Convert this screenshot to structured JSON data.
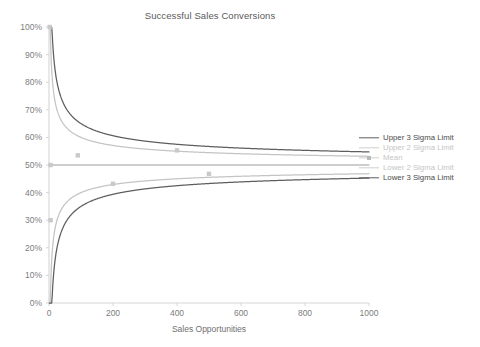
{
  "chart_data": {
    "type": "line",
    "title": "Successful Sales Conversions",
    "xlabel": "Sales Opportunities",
    "ylabel": "",
    "xlim": [
      0,
      1000
    ],
    "ylim": [
      0,
      1
    ],
    "xticks": [
      0,
      200,
      400,
      600,
      800,
      1000
    ],
    "xtick_labels": [
      "0",
      "200",
      "400",
      "600",
      "800",
      "1000"
    ],
    "yticks": [
      0,
      0.1,
      0.2,
      0.3,
      0.4,
      0.5,
      0.6,
      0.7,
      0.8,
      0.9,
      1
    ],
    "ytick_labels": [
      "0%",
      "10%",
      "20%",
      "30%",
      "40%",
      "50%",
      "60%",
      "70%",
      "80%",
      "90%",
      "100%"
    ],
    "grid": false,
    "legend_position": "right",
    "mean": 0.5,
    "series": [
      {
        "name": "Upper 3 Sigma Limit",
        "color": "#5e5e5e",
        "kind": "curve",
        "sigma": 3,
        "direction": "upper",
        "x": [
          1,
          2,
          3,
          5,
          8,
          12,
          20,
          30,
          50,
          80,
          120,
          200,
          300,
          400,
          500,
          600,
          700,
          800,
          900,
          1000
        ],
        "y": [
          1.0,
          1.0,
          0.866,
          0.771,
          0.677,
          0.644,
          0.617,
          0.591,
          0.571,
          0.556,
          0.546,
          0.535,
          0.529,
          0.525,
          0.522,
          0.52,
          0.519,
          0.518,
          0.517,
          0.516
        ]
      },
      {
        "name": "Upper 2 Sigma Limit",
        "color": "#c4c4c4",
        "kind": "curve",
        "sigma": 2,
        "direction": "upper",
        "x": [
          1,
          2,
          3,
          5,
          8,
          12,
          20,
          30,
          50,
          80,
          120,
          200,
          300,
          400,
          500,
          600,
          700,
          800,
          900,
          1000
        ],
        "y": [
          1.0,
          0.853,
          0.789,
          0.724,
          0.677,
          0.644,
          0.612,
          0.591,
          0.571,
          0.556,
          0.546,
          0.535,
          0.529,
          0.525,
          0.522,
          0.52,
          0.519,
          0.518,
          0.517,
          0.516
        ]
      },
      {
        "name": "Mean",
        "color": "#bdbdbd",
        "kind": "line",
        "value": 0.5,
        "x": [
          0,
          1000
        ],
        "y": [
          0.5,
          0.5
        ]
      },
      {
        "name": "Lower 2 Sigma Limit",
        "color": "#c4c4c4",
        "kind": "curve",
        "sigma": 2,
        "direction": "lower",
        "x": [
          1,
          2,
          3,
          5,
          8,
          12,
          20,
          30,
          50,
          80,
          120,
          200,
          300,
          400,
          500,
          600,
          700,
          800,
          900,
          1000
        ],
        "y": [
          0.0,
          0.147,
          0.211,
          0.276,
          0.323,
          0.356,
          0.388,
          0.409,
          0.429,
          0.444,
          0.454,
          0.465,
          0.471,
          0.475,
          0.478,
          0.48,
          0.481,
          0.482,
          0.483,
          0.484
        ]
      },
      {
        "name": "Lower 3 Sigma Limit",
        "color": "#5e5e5e",
        "kind": "curve",
        "sigma": 3,
        "direction": "lower",
        "x": [
          1,
          2,
          3,
          5,
          8,
          12,
          20,
          30,
          50,
          80,
          120,
          200,
          300,
          400,
          500,
          600,
          700,
          800,
          900,
          1000
        ],
        "y": [
          0.0,
          0.0,
          0.134,
          0.229,
          0.29,
          0.323,
          0.361,
          0.391,
          0.415,
          0.434,
          0.447,
          0.46,
          0.467,
          0.472,
          0.476,
          0.478,
          0.48,
          0.481,
          0.482,
          0.483
        ]
      }
    ],
    "points": {
      "name": "Observed Conversions",
      "color": "#c9c9c9",
      "x": [
        2,
        5,
        5,
        90,
        200,
        400,
        500
      ],
      "y": [
        1.0,
        0.5,
        0.3,
        0.535,
        0.432,
        0.553,
        0.468
      ]
    }
  },
  "legend": {
    "items": [
      {
        "label": "Upper 3 Sigma Limit",
        "color": "#5e5e5e",
        "text_color": "#4a4a4a",
        "marker": "line"
      },
      {
        "label": "Upper 2 Sigma Limit",
        "color": "#cfcfcf",
        "text_color": "#c6c6c6",
        "marker": "line"
      },
      {
        "label": "Mean",
        "color": "#cfcfcf",
        "text_color": "#c6c6c6",
        "marker": "dot"
      },
      {
        "label": "Lower 2 Sigma Limit",
        "color": "#cfcfcf",
        "text_color": "#c6c6c6",
        "marker": "line"
      },
      {
        "label": "Lower 3 Sigma Limit",
        "color": "#5e5e5e",
        "text_color": "#4a4a4a",
        "marker": "line"
      }
    ]
  },
  "axis": {
    "line_color": "#d6d6d6",
    "tick_color": "#7d7d7d"
  }
}
